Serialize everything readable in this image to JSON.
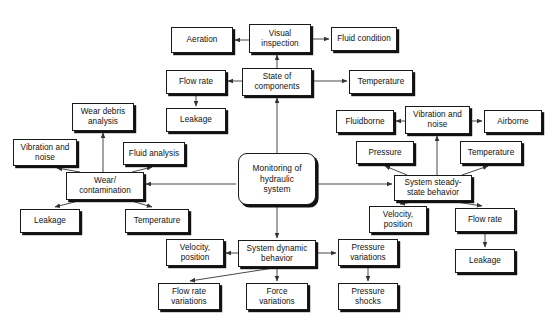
{
  "diagram": {
    "title": "Monitoring of hydraulic system",
    "background_color": "#ffffff",
    "line_color": "#333333",
    "box_border_color": "#1a1a1a",
    "box_fill_color": "#ffffff",
    "text_color": "#111111"
  },
  "nodes": [
    {
      "id": "aeration",
      "label": "Aeration",
      "x": 171,
      "y": 27,
      "w": 62,
      "h": 26,
      "shape": "rect"
    },
    {
      "id": "visual-inspection",
      "label": "Visual\ninspection",
      "x": 249,
      "y": 24,
      "w": 62,
      "h": 29,
      "shape": "rect"
    },
    {
      "id": "fluid-condition",
      "label": "Fluid condition",
      "x": 331,
      "y": 27,
      "w": 66,
      "h": 24,
      "shape": "rect"
    },
    {
      "id": "flow-rate-top",
      "label": "Flow rate",
      "x": 166,
      "y": 70,
      "w": 60,
      "h": 24,
      "shape": "rect"
    },
    {
      "id": "state-of-components",
      "label": "State of\ncomponents",
      "x": 242,
      "y": 68,
      "w": 70,
      "h": 28,
      "shape": "rect"
    },
    {
      "id": "temperature-top",
      "label": "Temperature",
      "x": 349,
      "y": 70,
      "w": 64,
      "h": 24,
      "shape": "rect"
    },
    {
      "id": "leakage-top",
      "label": "Leakage",
      "x": 166,
      "y": 108,
      "w": 60,
      "h": 24,
      "shape": "rect"
    },
    {
      "id": "wear-debris",
      "label": "Wear debris\nanalysis",
      "x": 72,
      "y": 103,
      "w": 62,
      "h": 28,
      "shape": "rect"
    },
    {
      "id": "fluidborne",
      "label": "Fluidborne",
      "x": 336,
      "y": 110,
      "w": 58,
      "h": 23,
      "shape": "rect"
    },
    {
      "id": "vibration-noise-r",
      "label": "Vibration and\nnoise",
      "x": 405,
      "y": 106,
      "w": 65,
      "h": 28,
      "shape": "rect"
    },
    {
      "id": "airborne",
      "label": "Airborne",
      "x": 484,
      "y": 110,
      "w": 58,
      "h": 23,
      "shape": "rect"
    },
    {
      "id": "vibration-noise-l",
      "label": "Vibration and\nnoise",
      "x": 13,
      "y": 139,
      "w": 64,
      "h": 27,
      "shape": "rect"
    },
    {
      "id": "fluid-analysis",
      "label": "Fluid analysis",
      "x": 123,
      "y": 142,
      "w": 62,
      "h": 23,
      "shape": "rect"
    },
    {
      "id": "pressure-ss",
      "label": "Pressure",
      "x": 356,
      "y": 141,
      "w": 58,
      "h": 23,
      "shape": "rect"
    },
    {
      "id": "temperature-ss",
      "label": "Temperature",
      "x": 460,
      "y": 141,
      "w": 62,
      "h": 23,
      "shape": "rect"
    },
    {
      "id": "wear-contamination",
      "label": "Wear/\ncontamination",
      "x": 66,
      "y": 172,
      "w": 78,
      "h": 28,
      "shape": "rect"
    },
    {
      "id": "monitoring-central",
      "label": "Monitoring of\nhydraulic\nsystem",
      "x": 238,
      "y": 153,
      "w": 78,
      "h": 52,
      "shape": "round"
    },
    {
      "id": "steady-state",
      "label": "System steady-\nstate behavior",
      "x": 394,
      "y": 175,
      "w": 78,
      "h": 26,
      "shape": "rect"
    },
    {
      "id": "leakage-left",
      "label": "Leakage",
      "x": 20,
      "y": 209,
      "w": 60,
      "h": 24,
      "shape": "rect"
    },
    {
      "id": "temperature-left",
      "label": "Temperature",
      "x": 125,
      "y": 209,
      "w": 64,
      "h": 24,
      "shape": "rect"
    },
    {
      "id": "velocity-ss",
      "label": "Velocity,\nposition",
      "x": 369,
      "y": 206,
      "w": 58,
      "h": 27,
      "shape": "rect"
    },
    {
      "id": "flow-rate-ss",
      "label": "Flow rate",
      "x": 455,
      "y": 208,
      "w": 60,
      "h": 24,
      "shape": "rect"
    },
    {
      "id": "leakage-ss",
      "label": "Leakage",
      "x": 455,
      "y": 249,
      "w": 60,
      "h": 24,
      "shape": "rect"
    },
    {
      "id": "velocity-dyn",
      "label": "Velocity,\nposition",
      "x": 166,
      "y": 239,
      "w": 58,
      "h": 27,
      "shape": "rect"
    },
    {
      "id": "system-dynamic",
      "label": "System dynamic\nbehavior",
      "x": 238,
      "y": 240,
      "w": 78,
      "h": 27,
      "shape": "rect"
    },
    {
      "id": "pressure-variations",
      "label": "Pressure\nvariations",
      "x": 338,
      "y": 239,
      "w": 60,
      "h": 27,
      "shape": "rect"
    },
    {
      "id": "flow-rate-variations",
      "label": "Flow rate\nvariations",
      "x": 158,
      "y": 283,
      "w": 62,
      "h": 27,
      "shape": "rect"
    },
    {
      "id": "force-variations",
      "label": "Force\nvariations",
      "x": 246,
      "y": 283,
      "w": 62,
      "h": 27,
      "shape": "rect"
    },
    {
      "id": "pressure-shocks",
      "label": "Pressure\nshocks",
      "x": 338,
      "y": 283,
      "w": 60,
      "h": 27,
      "shape": "rect"
    }
  ],
  "edges": [
    {
      "id": "e-visual-aeration",
      "from": "visual-inspection",
      "to": "aeration",
      "x1": 249,
      "y1": 40,
      "x2": 235,
      "y2": 40,
      "arrow": "end"
    },
    {
      "id": "e-visual-fluidcond",
      "from": "visual-inspection",
      "to": "fluid-condition",
      "x1": 311,
      "y1": 39,
      "x2": 329,
      "y2": 39,
      "arrow": "end"
    },
    {
      "id": "e-state-visual",
      "from": "state-of-components",
      "to": "visual-inspection",
      "x1": 277,
      "y1": 68,
      "x2": 277,
      "y2": 55,
      "arrow": "end"
    },
    {
      "id": "e-state-flowrate",
      "from": "state-of-components",
      "to": "flow-rate-top",
      "x1": 242,
      "y1": 81,
      "x2": 228,
      "y2": 81,
      "arrow": "end"
    },
    {
      "id": "e-state-temperature",
      "from": "state-of-components",
      "to": "temperature-top",
      "x1": 312,
      "y1": 81,
      "x2": 347,
      "y2": 81,
      "arrow": "end"
    },
    {
      "id": "e-flowrate-leakage",
      "from": "flow-rate-top",
      "to": "leakage-top",
      "x1": 196,
      "y1": 94,
      "x2": 196,
      "y2": 106,
      "arrow": "end"
    },
    {
      "id": "e-central-state",
      "from": "monitoring-central",
      "to": "state-of-components",
      "x1": 277,
      "y1": 153,
      "x2": 277,
      "y2": 98,
      "arrow": "end"
    },
    {
      "id": "e-vibr-fluidborne",
      "from": "vibration-noise-r",
      "to": "fluidborne",
      "x1": 405,
      "y1": 121,
      "x2": 396,
      "y2": 121,
      "arrow": "end"
    },
    {
      "id": "e-vibr-airborne",
      "from": "vibration-noise-r",
      "to": "airborne",
      "x1": 470,
      "y1": 121,
      "x2": 482,
      "y2": 121,
      "arrow": "end"
    },
    {
      "id": "e-steady-vibration",
      "from": "steady-state",
      "to": "vibration-noise-r",
      "x1": 437,
      "y1": 175,
      "x2": 437,
      "y2": 136,
      "arrow": "end"
    },
    {
      "id": "e-steady-pressure",
      "from": "steady-state",
      "to": "pressure-ss",
      "x1": 407,
      "y1": 175,
      "x2": 385,
      "y2": 166,
      "arrow": "end"
    },
    {
      "id": "e-steady-temperature",
      "from": "steady-state",
      "to": "temperature-ss",
      "x1": 462,
      "y1": 175,
      "x2": 488,
      "y2": 166,
      "arrow": "end"
    },
    {
      "id": "e-central-steady",
      "from": "monitoring-central",
      "to": "steady-state",
      "x1": 318,
      "y1": 184,
      "x2": 392,
      "y2": 184,
      "arrow": "end"
    },
    {
      "id": "e-central-wear",
      "from": "monitoring-central",
      "to": "wear-contamination",
      "x1": 236,
      "y1": 184,
      "x2": 146,
      "y2": 184,
      "arrow": "end"
    },
    {
      "id": "e-central-dynamic",
      "from": "monitoring-central",
      "to": "system-dynamic",
      "x1": 277,
      "y1": 207,
      "x2": 277,
      "y2": 238,
      "arrow": "end"
    },
    {
      "id": "e-weardebris-wear",
      "from": "wear-contamination",
      "to": "wear-debris",
      "x1": 103,
      "y1": 172,
      "x2": 103,
      "y2": 133,
      "arrow": "end"
    },
    {
      "id": "e-wear-vibration",
      "from": "wear-contamination",
      "to": "vibration-noise-l",
      "x1": 80,
      "y1": 172,
      "x2": 57,
      "y2": 168,
      "arrow": "end"
    },
    {
      "id": "e-wear-fluidanalysis",
      "from": "wear-contamination",
      "to": "fluid-analysis",
      "x1": 132,
      "y1": 172,
      "x2": 152,
      "y2": 167,
      "arrow": "end"
    },
    {
      "id": "e-wear-leakage",
      "from": "wear-contamination",
      "to": "leakage-left",
      "x1": 82,
      "y1": 200,
      "x2": 55,
      "y2": 207,
      "arrow": "end"
    },
    {
      "id": "e-wear-temperature",
      "from": "wear-contamination",
      "to": "temperature-left",
      "x1": 128,
      "y1": 200,
      "x2": 152,
      "y2": 207,
      "arrow": "end"
    },
    {
      "id": "e-steady-velocity",
      "from": "steady-state",
      "to": "velocity-ss",
      "x1": 419,
      "y1": 201,
      "x2": 400,
      "y2": 204,
      "arrow": "end"
    },
    {
      "id": "e-steady-flowrate",
      "from": "steady-state",
      "to": "flow-rate-ss",
      "x1": 450,
      "y1": 201,
      "x2": 482,
      "y2": 206,
      "arrow": "end"
    },
    {
      "id": "e-flowrate-leakage-ss",
      "from": "flow-rate-ss",
      "to": "leakage-ss",
      "x1": 485,
      "y1": 232,
      "x2": 485,
      "y2": 247,
      "arrow": "end"
    },
    {
      "id": "e-dynamic-velocity",
      "from": "system-dynamic",
      "to": "velocity-dyn",
      "x1": 238,
      "y1": 253,
      "x2": 226,
      "y2": 253,
      "arrow": "end"
    },
    {
      "id": "e-dynamic-pressurevar",
      "from": "system-dynamic",
      "to": "pressure-variations",
      "x1": 316,
      "y1": 253,
      "x2": 336,
      "y2": 253,
      "arrow": "end"
    },
    {
      "id": "e-dynamic-flowratevar",
      "from": "system-dynamic",
      "to": "flow-rate-variations",
      "x1": 280,
      "y1": 267,
      "x2": 190,
      "y2": 281,
      "arrow": "end"
    },
    {
      "id": "e-dynamic-forcevar",
      "from": "system-dynamic",
      "to": "force-variations",
      "x1": 277,
      "y1": 267,
      "x2": 277,
      "y2": 281,
      "arrow": "end"
    },
    {
      "id": "e-pressurevar-shocks",
      "from": "pressure-variations",
      "to": "pressure-shocks",
      "x1": 368,
      "y1": 266,
      "x2": 368,
      "y2": 281,
      "arrow": "end"
    }
  ]
}
